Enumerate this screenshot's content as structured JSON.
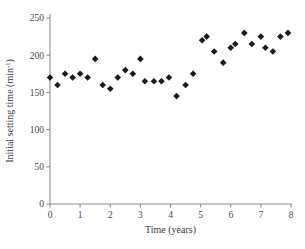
{
  "chart_data": {
    "type": "scatter",
    "title": "",
    "xlabel": "Time (years)",
    "ylabel": "Initial setting time (min",
    "ylabel_superscript": "-1",
    "ylabel_suffix": ")",
    "xlim": [
      0,
      8
    ],
    "ylim": [
      0,
      250
    ],
    "xticks": [
      0,
      1,
      2,
      3,
      4,
      5,
      6,
      7,
      8
    ],
    "yticks": [
      0,
      50,
      100,
      150,
      200,
      250
    ],
    "xtick_labels": [
      "0",
      "1",
      "2",
      "3",
      "4",
      "5",
      "6",
      "7",
      "8"
    ],
    "ytick_labels": [
      "0",
      "50",
      "100",
      "150",
      "200",
      "250"
    ],
    "grid": false,
    "legend": false,
    "marker": "diamond",
    "marker_color": "#1a1a1a",
    "points": [
      {
        "x": 0.0,
        "y": 170
      },
      {
        "x": 0.25,
        "y": 160
      },
      {
        "x": 0.5,
        "y": 175
      },
      {
        "x": 0.75,
        "y": 170
      },
      {
        "x": 1.0,
        "y": 175
      },
      {
        "x": 1.25,
        "y": 170
      },
      {
        "x": 1.5,
        "y": 195
      },
      {
        "x": 1.75,
        "y": 160
      },
      {
        "x": 2.0,
        "y": 155
      },
      {
        "x": 2.25,
        "y": 170
      },
      {
        "x": 2.5,
        "y": 180
      },
      {
        "x": 2.75,
        "y": 175
      },
      {
        "x": 3.0,
        "y": 195
      },
      {
        "x": 3.15,
        "y": 165
      },
      {
        "x": 3.45,
        "y": 165
      },
      {
        "x": 3.7,
        "y": 165
      },
      {
        "x": 3.95,
        "y": 170
      },
      {
        "x": 4.2,
        "y": 145
      },
      {
        "x": 4.5,
        "y": 160
      },
      {
        "x": 4.75,
        "y": 175
      },
      {
        "x": 5.05,
        "y": 220
      },
      {
        "x": 5.2,
        "y": 225
      },
      {
        "x": 5.45,
        "y": 205
      },
      {
        "x": 5.75,
        "y": 190
      },
      {
        "x": 6.0,
        "y": 210
      },
      {
        "x": 6.15,
        "y": 215
      },
      {
        "x": 6.45,
        "y": 230
      },
      {
        "x": 6.7,
        "y": 215
      },
      {
        "x": 7.0,
        "y": 225
      },
      {
        "x": 7.15,
        "y": 210
      },
      {
        "x": 7.4,
        "y": 205
      },
      {
        "x": 7.65,
        "y": 225
      },
      {
        "x": 7.9,
        "y": 230
      }
    ]
  },
  "geometry": {
    "x0_px": 50,
    "x8_px": 291,
    "y0_px": 204,
    "y250_px": 18
  }
}
